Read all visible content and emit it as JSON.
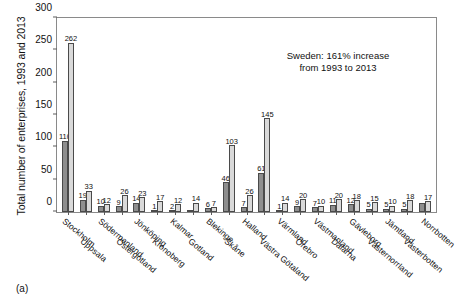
{
  "caption": "(a)",
  "annotation": {
    "line1": "Sweden: 161% increase",
    "line2": "from 1993 to 2013"
  },
  "chart_data": {
    "type": "bar",
    "title": "",
    "ylabel": "Total number of enterprises, 1993 and 2013",
    "xlabel": "",
    "ylim": [
      0,
      300
    ],
    "yticks": [
      0,
      50,
      100,
      150,
      200,
      250,
      300
    ],
    "grid": false,
    "legend_position": "none",
    "annotations": [
      "Sweden: 161% increase from 1993 to 2013"
    ],
    "categories": [
      "Stockholm",
      "Uppsala",
      "Södermanland",
      "Östergötland",
      "Jönköping",
      "Kronoberg",
      "Kalmar",
      "Gotland",
      "Blekinge",
      "Skåne",
      "Halland",
      "Västra Götaland",
      "Värmland",
      "Örebro",
      "Västmanland",
      "Dalarna",
      "Gävleborg",
      "Västernorrland",
      "Jämtland",
      "Västerbotten",
      "Norrbotten"
    ],
    "series": [
      {
        "name": "1993",
        "color": "#8e8e8e",
        "values": [
          110,
          19,
          10,
          9,
          14,
          1,
          2,
          1,
          6,
          46,
          7,
          61,
          1,
          9,
          7,
          11,
          12,
          5,
          5,
          5,
          14
        ]
      },
      {
        "name": "2013",
        "color": "#d9d9d9",
        "values": [
          262,
          33,
          12,
          26,
          23,
          17,
          12,
          14,
          7,
          103,
          26,
          145,
          14,
          20,
          10,
          20,
          18,
          15,
          10,
          18,
          17
        ]
      }
    ],
    "value_labels": {
      "1993": [
        "110",
        "19",
        "10",
        "9",
        "14",
        "1",
        "2",
        "",
        "6",
        "46",
        "7",
        "61",
        "1",
        "9",
        "7",
        "11",
        "12",
        "5",
        "5",
        "5",
        ""
      ],
      "2013": [
        "262",
        "33",
        "12",
        "26",
        "23",
        "17",
        "12",
        "14",
        "7",
        "103",
        "26",
        "145",
        "14",
        "20",
        "10",
        "20",
        "18",
        "15",
        "10",
        "18",
        "17"
      ]
    }
  }
}
